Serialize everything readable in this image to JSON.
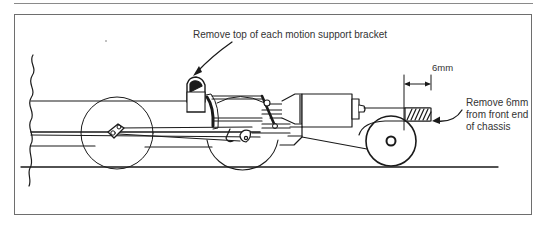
{
  "figure": {
    "annotations": {
      "bracket_note": "Remove top of each motion support bracket",
      "dimension_label": "6mm",
      "chassis_note_line1": "Remove 6mm",
      "chassis_note_line2": "from front end",
      "chassis_note_line3": "of chassis"
    },
    "components": [
      "break-line",
      "large-driving-wheel",
      "second-driving-wheel",
      "small-front-wheel",
      "motion-support-bracket",
      "connecting-rods",
      "motor-cylinder",
      "chassis-front-end-hatched",
      "rail-line"
    ],
    "colors": {
      "line": "#1a1a1a",
      "frame": "#6e6e6e",
      "text": "#333333"
    }
  }
}
